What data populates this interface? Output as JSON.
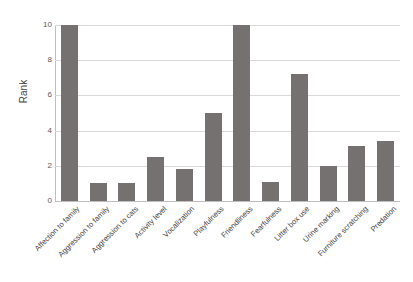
{
  "chart_data": {
    "type": "bar",
    "title": "",
    "xlabel": "",
    "ylabel": "Rank",
    "ylim": [
      0,
      10
    ],
    "yticks": [
      0,
      2,
      4,
      6,
      8,
      10
    ],
    "ytick_labels": [
      "0",
      "2",
      "4",
      "6",
      "8",
      "10"
    ],
    "grid": "horizontal",
    "legend": "none",
    "bar_color": "#767171",
    "gridline_color": "#d9d9d9",
    "background_color": "#ffffff",
    "axis_label_color": "#3f3f3f",
    "tick_label_color": "#5a5a5a",
    "xtick_rotation_degrees": -45,
    "categories": [
      "Affection to family",
      "Aggression to family",
      "Aggression to cats",
      "Activity level",
      "Vocalization",
      "Playfulness",
      "Friendliness",
      "Fearfulness",
      "Litter box use",
      "Urine marking",
      "Furniture scratching",
      "Predation"
    ],
    "values": [
      10,
      1,
      1,
      2.5,
      1.8,
      5,
      10,
      1.1,
      7.2,
      2,
      3.1,
      3.4
    ]
  }
}
